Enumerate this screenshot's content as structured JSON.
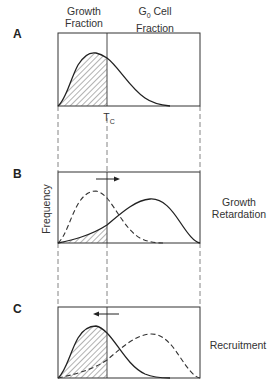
{
  "header": {
    "growth_fraction_line1": "Growth",
    "growth_fraction_line2": "Fraction",
    "g0_symbol": "G",
    "g0_subscript": "0",
    "g0_label_rest": " Cell",
    "g0_line2": "Fraction"
  },
  "panels": [
    {
      "id": "A",
      "label": "A",
      "right_label": ""
    },
    {
      "id": "B",
      "label": "B",
      "right_label_line1": "Growth",
      "right_label_line2": "Retardation",
      "arrow_direction": "right"
    },
    {
      "id": "C",
      "label": "C",
      "right_label": "Recruitment",
      "arrow_direction": "left"
    }
  ],
  "threshold": {
    "symbol": "T",
    "subscript": "C"
  },
  "y_axis_label": "Frequency",
  "colors": {
    "line": "#333333",
    "hatch": "#555555",
    "background": "#ffffff"
  }
}
